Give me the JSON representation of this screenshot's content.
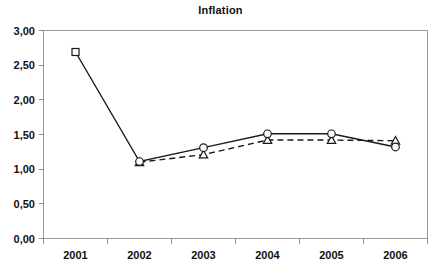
{
  "chart_data": {
    "type": "line",
    "title": "Inflation",
    "xlabel": "",
    "ylabel": "",
    "categories": [
      "2001",
      "2002",
      "2003",
      "2004",
      "2005",
      "2006"
    ],
    "ylim": [
      0,
      3
    ],
    "ytick_labels": [
      "0,00",
      "0,50",
      "1,00",
      "1,50",
      "2,00",
      "2,50",
      "3,00"
    ],
    "ytick_values": [
      0,
      0.5,
      1,
      1.5,
      2,
      2.5,
      3
    ],
    "grid": false,
    "legend": "none",
    "decimal_separator": ",",
    "series": [
      {
        "name": "series-solid",
        "line_style": "solid",
        "marker": "circle",
        "first_marker": "square",
        "values": [
          2.69,
          1.11,
          1.31,
          1.51,
          1.51,
          1.32
        ]
      },
      {
        "name": "series-dashed",
        "line_style": "dashed",
        "marker": "triangle",
        "values": [
          null,
          1.1,
          1.21,
          1.42,
          1.42,
          1.41
        ]
      }
    ]
  },
  "title": {
    "text": "Inflation"
  },
  "axes": {
    "y_labels": [
      "3,00",
      "2,50",
      "2,00",
      "1,50",
      "1,00",
      "0,50",
      "0,00"
    ],
    "x_labels": [
      "2001",
      "2002",
      "2003",
      "2004",
      "2005",
      "2006"
    ]
  }
}
